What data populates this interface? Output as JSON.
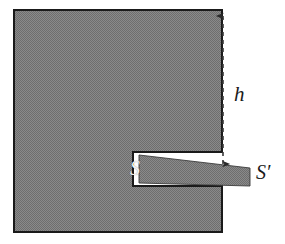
{
  "figure": {
    "kind": "geometry-diagram",
    "background_color": "#ffffff",
    "fill_color": "#808080",
    "fill_pattern": "checkerboard-dither-50",
    "outline_color": "#1a1a1a",
    "labels": [
      {
        "id": "h",
        "text": "h",
        "meaning": "height dimension from top edge of block to slot",
        "style": "italic-serif",
        "color": "#1a1a1a",
        "x": 234,
        "y": 84
      },
      {
        "id": "s",
        "text": "S",
        "meaning": "slot / surface inside the block",
        "style": "italic-serif",
        "color": "#f2f2f2",
        "x": 130,
        "y": 158
      },
      {
        "id": "s-prime",
        "text": "S′",
        "meaning": "wedge inserted into the slot",
        "style": "italic-serif",
        "color": "#1a1a1a",
        "x": 256,
        "y": 162
      }
    ],
    "dimension_line": {
      "id": "h-dimension",
      "style": "dashed",
      "color": "#3a3a3a",
      "arrowheads": "both-ends",
      "x": 223,
      "y_top": 11,
      "y_bottom": 170
    },
    "geometry": {
      "block_outline": "14,10 222,10 222,152 133,152 133,186 222,186 222,232 14,232",
      "wedge_outline": "139,155 250,168 250,186 139,183",
      "block_top": 10,
      "block_bottom": 232,
      "block_left": 14,
      "block_right": 222,
      "slot_left": 133,
      "slot_top": 152,
      "slot_bottom": 186
    }
  }
}
